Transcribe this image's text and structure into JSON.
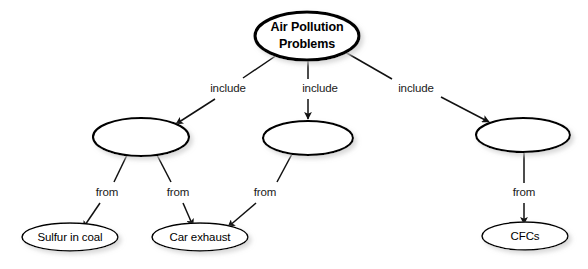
{
  "diagram": {
    "type": "concept-map",
    "title": "Air Pollution Problems",
    "background_color": "#ffffff",
    "stroke_color": "#000000",
    "nodes": [
      {
        "id": "root",
        "label": "Air Pollution\nProblems",
        "line1": "Air Pollution",
        "line2": "Problems",
        "level": "root",
        "cx": 307,
        "cy": 36,
        "rx": 52,
        "ry": 24
      },
      {
        "id": "mid1",
        "label": "",
        "line1": "",
        "line2": "",
        "level": "middle",
        "cx": 141,
        "cy": 137,
        "rx": 48,
        "ry": 19
      },
      {
        "id": "mid2",
        "label": "",
        "line1": "",
        "line2": "",
        "level": "middle",
        "cx": 308,
        "cy": 138,
        "rx": 45,
        "ry": 17
      },
      {
        "id": "mid3",
        "label": "",
        "line1": "",
        "line2": "",
        "level": "middle",
        "cx": 523,
        "cy": 135,
        "rx": 47,
        "ry": 17
      },
      {
        "id": "leaf1",
        "label": "Sulfur in coal",
        "line1": "Sulfur in coal",
        "line2": "",
        "level": "leaf",
        "cx": 70,
        "cy": 237,
        "rx": 48,
        "ry": 14
      },
      {
        "id": "leaf2",
        "label": "Car exhaust",
        "line1": "Car exhaust",
        "line2": "",
        "level": "leaf",
        "cx": 200,
        "cy": 237,
        "rx": 48,
        "ry": 14
      },
      {
        "id": "leaf3",
        "label": "CFCs",
        "line1": "CFCs",
        "line2": "",
        "level": "leaf",
        "cx": 525,
        "cy": 236,
        "rx": 43,
        "ry": 14
      }
    ],
    "edges": [
      {
        "id": "e1",
        "from": "root",
        "to": "mid1",
        "label": "include",
        "label_x": 228,
        "label_y": 89
      },
      {
        "id": "e2",
        "from": "root",
        "to": "mid2",
        "label": "include",
        "label_x": 320,
        "label_y": 89
      },
      {
        "id": "e3",
        "from": "root",
        "to": "mid3",
        "label": "include",
        "label_x": 416,
        "label_y": 89
      },
      {
        "id": "e4",
        "from": "mid1",
        "to": "leaf1",
        "label": "from",
        "label_x": 107,
        "label_y": 193
      },
      {
        "id": "e5",
        "from": "mid1",
        "to": "leaf2",
        "label": "from",
        "label_x": 178,
        "label_y": 193
      },
      {
        "id": "e6",
        "from": "mid2",
        "to": "leaf2",
        "label": "from",
        "label_x": 265,
        "label_y": 193
      },
      {
        "id": "e7",
        "from": "mid3",
        "to": "leaf3",
        "label": "from",
        "label_x": 524,
        "label_y": 193
      }
    ],
    "edge_labels": [
      "include",
      "include",
      "include",
      "from",
      "from",
      "from",
      "from"
    ]
  }
}
